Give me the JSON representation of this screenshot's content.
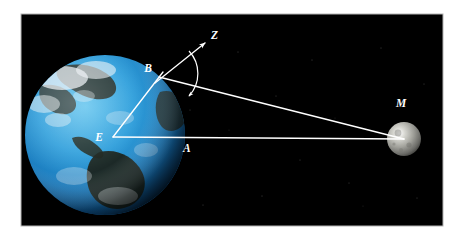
{
  "figure": {
    "panel_background": "#000000",
    "page_background": "#ffffff",
    "border_color": "#b4b4b4",
    "line_color": "#ffffff"
  },
  "panel": {
    "x": 21,
    "y": 14,
    "width": 422,
    "height": 212
  },
  "bodies": [
    {
      "name": "earth",
      "label": "",
      "cx": 105,
      "cy": 135,
      "r": 80,
      "ocean_color": "#2a93d5",
      "deep_ocean_color": "#0d5c96",
      "land_color": "#1d2a22",
      "cloud_color": "#e8eef2"
    },
    {
      "name": "moon",
      "label": "",
      "cx": 404,
      "cy": 139,
      "r": 17,
      "surface_color": "#9a9a96",
      "shadow_color": "#2a2a28",
      "highlight_color": "#d8d8d2"
    }
  ],
  "points": [
    {
      "id": "E",
      "label": "E",
      "meaning": "earth-center",
      "x": 113,
      "y": 137,
      "label_x": 103,
      "label_y": 141
    },
    {
      "id": "B",
      "label": "B",
      "meaning": "observer-on-surface",
      "x": 163,
      "y": 72,
      "label_x": 152,
      "label_y": 72
    },
    {
      "id": "A",
      "label": "A",
      "meaning": "point-on-earth-moon-line",
      "x": 187,
      "y": 137,
      "label_x": 183,
      "label_y": 150
    },
    {
      "id": "Z",
      "label": "Z",
      "meaning": "zenith-direction",
      "x": 207,
      "y": 41,
      "label_x": 211,
      "label_y": 38
    },
    {
      "id": "M",
      "label": "M",
      "meaning": "moon-center",
      "x": 404,
      "y": 139,
      "label_x": 400,
      "label_y": 106
    }
  ],
  "lines": [
    {
      "name": "line-E-to-M",
      "from": "E",
      "to": "M",
      "x1": 113,
      "y1": 137,
      "x2": 404,
      "y2": 139,
      "arrow": false
    },
    {
      "name": "line-E-to-B",
      "from": "E",
      "to": "B",
      "x1": 113,
      "y1": 137,
      "x2": 163,
      "y2": 72,
      "arrow": false
    },
    {
      "name": "line-B-to-M",
      "from": "B",
      "to": "M",
      "x1": 159,
      "y1": 77,
      "x2": 404,
      "y2": 139,
      "arrow": false
    },
    {
      "name": "line-B-to-Z",
      "from": "B",
      "to": "Z",
      "x1": 155,
      "y1": 83,
      "x2": 206,
      "y2": 42,
      "arrow": true
    }
  ],
  "angle_arc": {
    "name": "parallax-angle-arc",
    "vertex": "B",
    "between": [
      "Z",
      "M"
    ],
    "arrow_end": "toward-moon-line",
    "cx": 163,
    "cy": 72,
    "radius": 33
  },
  "labels": {
    "E": "E",
    "B": "B",
    "A": "A",
    "Z": "Z",
    "M": "M"
  }
}
